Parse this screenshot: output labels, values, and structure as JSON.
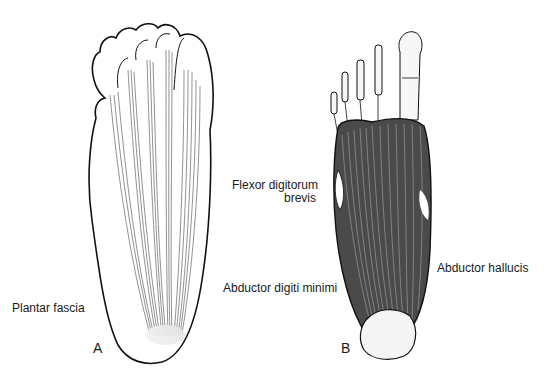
{
  "figure": {
    "panels": [
      {
        "id": "A",
        "letter": "A",
        "structure": "plantar-fascia"
      },
      {
        "id": "B",
        "letter": "B",
        "structure": "plantar-muscles-first-layer"
      }
    ],
    "labels": {
      "plantar_fascia": "Plantar fascia",
      "flexor_line1": "Flexor digitorum",
      "flexor_line2": "brevis",
      "abductor_digiti_minimi": "Abductor digiti minimi",
      "abductor_hallucis": "Abductor hallucis"
    },
    "colors": {
      "outline": "#111111",
      "fascia_lines": "#6a6a6a",
      "muscle_dark": "#3a3a3a",
      "muscle_light": "#8a8a8a",
      "bone_fill": "#f4f4f4",
      "background": "#ffffff"
    }
  }
}
